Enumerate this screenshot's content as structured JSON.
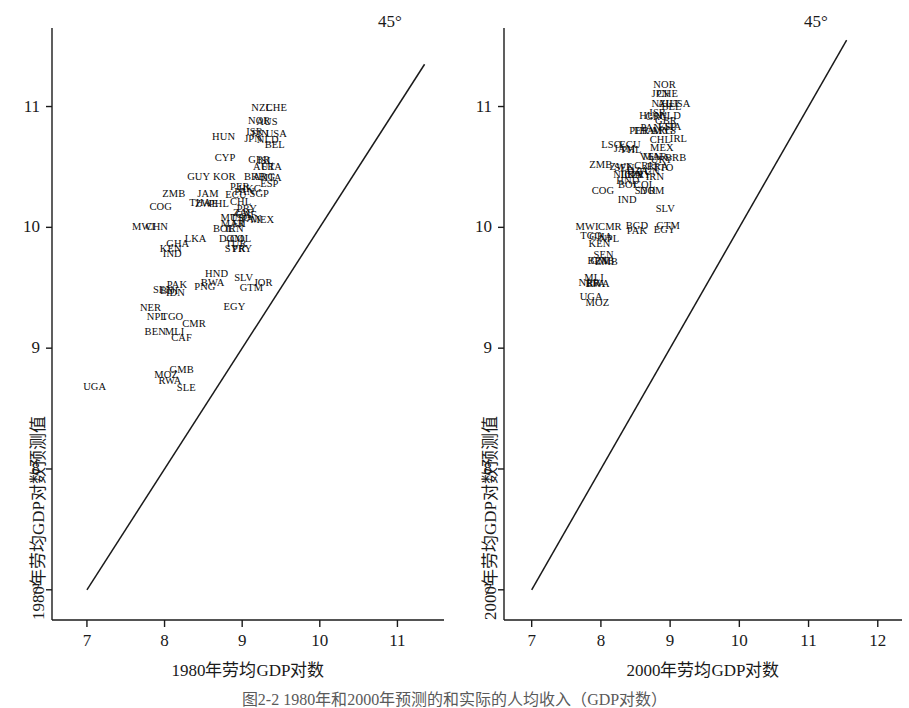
{
  "figure": {
    "caption": "图2-2  1980年和2000年预测的和实际的人均收入（GDP对数）"
  },
  "chart_data": [
    {
      "type": "scatter",
      "panel": "left",
      "title": "",
      "xlabel": "1980年劳均GDP对数",
      "ylabel": "1980年劳均GDP对数预测值",
      "xlim": [
        6.55,
        11.6
      ],
      "ylim": [
        6.75,
        11.65
      ],
      "xticks": [
        7,
        8,
        9,
        10,
        11
      ],
      "yticks": [
        7,
        8,
        9,
        10,
        11
      ],
      "grid": false,
      "legend": "none",
      "annotations": [
        {
          "text": "45°",
          "x": 11.2,
          "y": 11.55
        }
      ],
      "reference_line": {
        "label": "45°",
        "type": "identity",
        "from": [
          7.0,
          7.0
        ],
        "to": [
          11.35,
          11.35
        ]
      },
      "points": [
        {
          "label": "UGA",
          "x": 7.1,
          "y": 8.68
        },
        {
          "label": "MOZ",
          "x": 8.02,
          "y": 8.78
        },
        {
          "label": "GMB",
          "x": 8.22,
          "y": 8.82
        },
        {
          "label": "RWA",
          "x": 8.07,
          "y": 8.73
        },
        {
          "label": "SLE",
          "x": 8.28,
          "y": 8.67
        },
        {
          "label": "BEN",
          "x": 7.88,
          "y": 9.13
        },
        {
          "label": "MLI",
          "x": 8.13,
          "y": 9.13
        },
        {
          "label": "CAF",
          "x": 8.22,
          "y": 9.08
        },
        {
          "label": "NER",
          "x": 7.82,
          "y": 9.33
        },
        {
          "label": "NPL",
          "x": 7.9,
          "y": 9.26
        },
        {
          "label": "TGO",
          "x": 8.1,
          "y": 9.26
        },
        {
          "label": "CMR",
          "x": 8.38,
          "y": 9.2
        },
        {
          "label": "EGY",
          "x": 8.9,
          "y": 9.34
        },
        {
          "label": "SEN",
          "x": 7.98,
          "y": 9.48
        },
        {
          "label": "BDI",
          "x": 8.06,
          "y": 9.47
        },
        {
          "label": "IDN",
          "x": 8.14,
          "y": 9.46
        },
        {
          "label": "PAK",
          "x": 8.16,
          "y": 9.52
        },
        {
          "label": "PNG",
          "x": 8.52,
          "y": 9.51
        },
        {
          "label": "BWA",
          "x": 8.62,
          "y": 9.54
        },
        {
          "label": "HND",
          "x": 8.67,
          "y": 9.61
        },
        {
          "label": "SLV",
          "x": 9.02,
          "y": 9.58
        },
        {
          "label": "GTM",
          "x": 9.12,
          "y": 9.5
        },
        {
          "label": "JOR",
          "x": 9.27,
          "y": 9.54
        },
        {
          "label": "KEN",
          "x": 8.08,
          "y": 9.82
        },
        {
          "label": "IND",
          "x": 8.1,
          "y": 9.78
        },
        {
          "label": "GHA",
          "x": 8.17,
          "y": 9.86
        },
        {
          "label": "LKA",
          "x": 8.4,
          "y": 9.9
        },
        {
          "label": "MWI",
          "x": 7.73,
          "y": 10.0
        },
        {
          "label": "CHN",
          "x": 7.9,
          "y": 10.0
        },
        {
          "label": "BOL",
          "x": 8.76,
          "y": 9.99
        },
        {
          "label": "IRN",
          "x": 8.9,
          "y": 9.99
        },
        {
          "label": "MAR",
          "x": 8.88,
          "y": 10.03
        },
        {
          "label": "FJI",
          "x": 8.96,
          "y": 10.03
        },
        {
          "label": "MUS",
          "x": 8.87,
          "y": 10.08
        },
        {
          "label": "TTO",
          "x": 8.98,
          "y": 10.08
        },
        {
          "label": "CAF2",
          "x": 9.05,
          "y": 10.1
        },
        {
          "label": "PRY",
          "x": 9.06,
          "y": 10.15
        },
        {
          "label": "ZAF",
          "x": 9.01,
          "y": 10.12
        },
        {
          "label": "PAN",
          "x": 9.12,
          "y": 10.07
        },
        {
          "label": "MEX",
          "x": 9.26,
          "y": 10.06
        },
        {
          "label": "COL",
          "x": 8.98,
          "y": 9.9
        },
        {
          "label": "DOM",
          "x": 8.86,
          "y": 9.9
        },
        {
          "label": "TUR",
          "x": 8.92,
          "y": 9.86
        },
        {
          "label": "SYR",
          "x": 8.91,
          "y": 9.82
        },
        {
          "label": "PRY2",
          "x": 9.0,
          "y": 9.82
        },
        {
          "label": "COG",
          "x": 7.95,
          "y": 10.17
        },
        {
          "label": "THA",
          "x": 8.46,
          "y": 10.2
        },
        {
          "label": "ZWE",
          "x": 8.54,
          "y": 10.19
        },
        {
          "label": "PHL",
          "x": 8.7,
          "y": 10.19
        },
        {
          "label": "CHL",
          "x": 8.98,
          "y": 10.21
        },
        {
          "label": "ZMB",
          "x": 8.12,
          "y": 10.28
        },
        {
          "label": "JAM",
          "x": 8.56,
          "y": 10.28
        },
        {
          "label": "ECU",
          "x": 8.92,
          "y": 10.27
        },
        {
          "label": "PAN2",
          "x": 9.03,
          "y": 10.29
        },
        {
          "label": "SGP",
          "x": 9.22,
          "y": 10.28
        },
        {
          "label": "PER",
          "x": 8.97,
          "y": 10.33
        },
        {
          "label": "HKG",
          "x": 9.1,
          "y": 10.32
        },
        {
          "label": "GUY",
          "x": 8.44,
          "y": 10.42
        },
        {
          "label": "KOR",
          "x": 8.77,
          "y": 10.42
        },
        {
          "label": "BRB",
          "x": 9.16,
          "y": 10.42
        },
        {
          "label": "ARG",
          "x": 9.28,
          "y": 10.42
        },
        {
          "label": "ITA",
          "x": 9.4,
          "y": 10.41
        },
        {
          "label": "ESP",
          "x": 9.35,
          "y": 10.36
        },
        {
          "label": "CYP",
          "x": 8.78,
          "y": 10.57
        },
        {
          "label": "GBR",
          "x": 9.22,
          "y": 10.56
        },
        {
          "label": "ISL",
          "x": 9.3,
          "y": 10.55
        },
        {
          "label": "AUT",
          "x": 9.28,
          "y": 10.5
        },
        {
          "label": "FRA",
          "x": 9.38,
          "y": 10.5
        },
        {
          "label": "HUN",
          "x": 8.76,
          "y": 10.75
        },
        {
          "label": "JPN",
          "x": 9.14,
          "y": 10.73
        },
        {
          "label": "ISR",
          "x": 9.16,
          "y": 10.79
        },
        {
          "label": "FIN",
          "x": 9.23,
          "y": 10.77
        },
        {
          "label": "NLD",
          "x": 9.33,
          "y": 10.72
        },
        {
          "label": "USA",
          "x": 9.44,
          "y": 10.77
        },
        {
          "label": "BEL",
          "x": 9.42,
          "y": 10.68
        },
        {
          "label": "NOR",
          "x": 9.22,
          "y": 10.88
        },
        {
          "label": "AUS",
          "x": 9.32,
          "y": 10.87
        },
        {
          "label": "NZL",
          "x": 9.25,
          "y": 10.99
        },
        {
          "label": "CHE",
          "x": 9.44,
          "y": 10.99
        }
      ]
    },
    {
      "type": "scatter",
      "panel": "right",
      "title": "",
      "xlabel": "2000年劳均GDP对数",
      "ylabel": "2000年劳均GDP对数预测值",
      "xlim": [
        6.6,
        12.35
      ],
      "ylim": [
        6.75,
        11.65
      ],
      "xticks": [
        7,
        8,
        9,
        10,
        11,
        12
      ],
      "yticks": [
        7,
        8,
        9,
        10,
        11
      ],
      "grid": false,
      "legend": "none",
      "annotations": [
        {
          "text": "45°",
          "x": 11.75,
          "y": 11.55
        }
      ],
      "reference_line": {
        "label": "45°",
        "type": "identity",
        "from": [
          7.0,
          7.0
        ],
        "to": [
          11.55,
          11.55
        ]
      },
      "points": [
        {
          "label": "UGA",
          "x": 7.86,
          "y": 9.42
        },
        {
          "label": "MOZ",
          "x": 7.95,
          "y": 9.37
        },
        {
          "label": "MLI",
          "x": 7.9,
          "y": 9.58
        },
        {
          "label": "NER",
          "x": 7.83,
          "y": 9.54
        },
        {
          "label": "BFA",
          "x": 7.92,
          "y": 9.53
        },
        {
          "label": "RWA",
          "x": 7.96,
          "y": 9.53
        },
        {
          "label": "SEN",
          "x": 8.04,
          "y": 9.77
        },
        {
          "label": "GMB",
          "x": 8.02,
          "y": 9.72
        },
        {
          "label": "BEN",
          "x": 7.96,
          "y": 9.72
        },
        {
          "label": "ZMB2",
          "x": 8.08,
          "y": 9.71
        },
        {
          "label": "MWI",
          "x": 7.8,
          "y": 10.0
        },
        {
          "label": "TGO",
          "x": 7.86,
          "y": 9.93
        },
        {
          "label": "GHA",
          "x": 8.0,
          "y": 9.92
        },
        {
          "label": "NPL",
          "x": 8.12,
          "y": 9.9
        },
        {
          "label": "CMR",
          "x": 8.13,
          "y": 10.0
        },
        {
          "label": "KEN",
          "x": 7.98,
          "y": 9.86
        },
        {
          "label": "PAK",
          "x": 8.52,
          "y": 9.97
        },
        {
          "label": "BGD",
          "x": 8.52,
          "y": 10.01
        },
        {
          "label": "EGY",
          "x": 8.92,
          "y": 9.98
        },
        {
          "label": "GTM",
          "x": 8.97,
          "y": 10.01
        },
        {
          "label": "SLV",
          "x": 8.93,
          "y": 10.15
        },
        {
          "label": "IND",
          "x": 8.38,
          "y": 10.23
        },
        {
          "label": "COG",
          "x": 8.03,
          "y": 10.3
        },
        {
          "label": "BOL",
          "x": 8.4,
          "y": 10.35
        },
        {
          "label": "HND",
          "x": 8.39,
          "y": 10.38
        },
        {
          "label": "COL",
          "x": 8.63,
          "y": 10.35
        },
        {
          "label": "SYR",
          "x": 8.64,
          "y": 10.3
        },
        {
          "label": "DOM",
          "x": 8.74,
          "y": 10.3
        },
        {
          "label": "NIC",
          "x": 8.31,
          "y": 10.43
        },
        {
          "label": "LKA",
          "x": 8.44,
          "y": 10.43
        },
        {
          "label": "IDN",
          "x": 8.47,
          "y": 10.43
        },
        {
          "label": "PRY",
          "x": 8.58,
          "y": 10.43
        },
        {
          "label": "DZA",
          "x": 8.53,
          "y": 10.47
        },
        {
          "label": "TUN",
          "x": 8.69,
          "y": 10.46
        },
        {
          "label": "IRN",
          "x": 8.78,
          "y": 10.42
        },
        {
          "label": "ZWE",
          "x": 8.29,
          "y": 10.5
        },
        {
          "label": "SEN2",
          "x": 8.34,
          "y": 10.49
        },
        {
          "label": "ZMB",
          "x": 8.0,
          "y": 10.52
        },
        {
          "label": "CRI",
          "x": 8.61,
          "y": 10.51
        },
        {
          "label": "BRA",
          "x": 8.82,
          "y": 10.5
        },
        {
          "label": "TTO",
          "x": 8.9,
          "y": 10.49
        },
        {
          "label": "VEN",
          "x": 8.72,
          "y": 10.58
        },
        {
          "label": "MAR",
          "x": 8.78,
          "y": 10.58
        },
        {
          "label": "URY",
          "x": 8.88,
          "y": 10.56
        },
        {
          "label": "BRB",
          "x": 9.08,
          "y": 10.57
        },
        {
          "label": "JAM",
          "x": 8.34,
          "y": 10.65
        },
        {
          "label": "PHL",
          "x": 8.44,
          "y": 10.64
        },
        {
          "label": "ECU",
          "x": 8.42,
          "y": 10.68
        },
        {
          "label": "LSO",
          "x": 8.15,
          "y": 10.68
        },
        {
          "label": "MEX",
          "x": 8.88,
          "y": 10.66
        },
        {
          "label": "CHL",
          "x": 8.86,
          "y": 10.72
        },
        {
          "label": "PER",
          "x": 8.55,
          "y": 10.8
        },
        {
          "label": "THA",
          "x": 8.62,
          "y": 10.8
        },
        {
          "label": "PAN",
          "x": 8.72,
          "y": 10.82
        },
        {
          "label": "ARG",
          "x": 8.88,
          "y": 10.8
        },
        {
          "label": "MYS",
          "x": 8.92,
          "y": 10.8
        },
        {
          "label": "IRL",
          "x": 9.12,
          "y": 10.73
        },
        {
          "label": "HUN",
          "x": 8.72,
          "y": 10.92
        },
        {
          "label": "GRC",
          "x": 8.8,
          "y": 10.91
        },
        {
          "label": "ISR",
          "x": 8.82,
          "y": 10.95
        },
        {
          "label": "GBR",
          "x": 8.94,
          "y": 10.88
        },
        {
          "label": "ESP",
          "x": 8.96,
          "y": 10.83
        },
        {
          "label": "ITA",
          "x": 9.04,
          "y": 10.83
        },
        {
          "label": "NLD",
          "x": 9.0,
          "y": 10.92
        },
        {
          "label": "USA",
          "x": 9.14,
          "y": 11.02
        },
        {
          "label": "NZL",
          "x": 8.88,
          "y": 11.02
        },
        {
          "label": "AUT",
          "x": 8.98,
          "y": 11.02
        },
        {
          "label": "BEL",
          "x": 9.02,
          "y": 11.0
        },
        {
          "label": "JPN",
          "x": 8.86,
          "y": 11.1
        },
        {
          "label": "CHE",
          "x": 8.96,
          "y": 11.1
        },
        {
          "label": "NOR",
          "x": 8.92,
          "y": 11.18
        }
      ]
    }
  ],
  "panels": {
    "left": {
      "xlabel": "1980年劳均GDP对数",
      "ylabel": "1980年劳均GDP对数预测值",
      "line_label": "45°",
      "xticks": [
        "7",
        "8",
        "9",
        "10",
        "11"
      ],
      "yticks": [
        "11",
        "10",
        "9",
        "8",
        "7"
      ]
    },
    "right": {
      "xlabel": "2000年劳均GDP对数",
      "ylabel": "2000年劳均GDP对数预测值",
      "line_label": "45°",
      "xticks": [
        "7",
        "8",
        "9",
        "10",
        "11",
        "12"
      ],
      "yticks": [
        "11",
        "10",
        "9",
        "8",
        "7"
      ]
    }
  },
  "colors": {
    "ink": "#1a1a1a",
    "background": "#ffffff",
    "caption": "#5a5a5a"
  }
}
